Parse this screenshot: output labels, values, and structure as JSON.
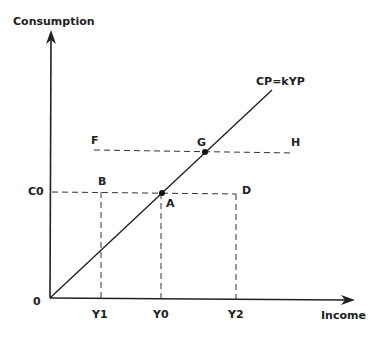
{
  "diagram": {
    "y_axis_label": "Consumption",
    "x_axis_label": "Income",
    "origin_label": "0",
    "line_label": "CP=kYP",
    "y_ticks": [
      {
        "label": "C0"
      }
    ],
    "x_ticks": [
      {
        "label": "Y1"
      },
      {
        "label": "Y0"
      },
      {
        "label": "Y2"
      }
    ],
    "points": {
      "A": "A",
      "B": "B",
      "D": "D",
      "F": "F",
      "G": "G",
      "H": "H"
    },
    "colors": {
      "ink": "#222222",
      "background": "#ffffff"
    }
  }
}
